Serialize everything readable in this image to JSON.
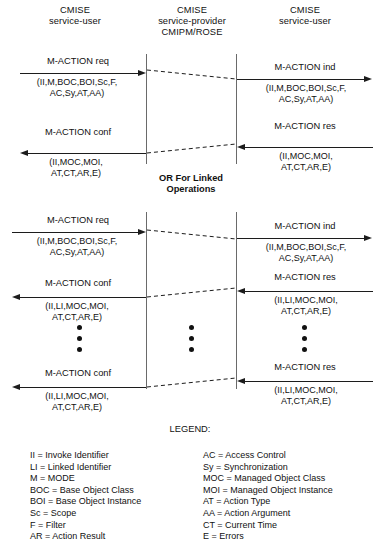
{
  "diagram": {
    "columns": [
      {
        "name": "left-actor",
        "lines": [
          "CMISE",
          "service-user"
        ]
      },
      {
        "name": "provider",
        "lines": [
          "CMISE",
          "service-provider",
          "CMIPM/ROSE"
        ]
      },
      {
        "name": "right-actor",
        "lines": [
          "CMISE",
          "service-user"
        ]
      }
    ],
    "divider_label": [
      "OR For Linked",
      "Operations"
    ],
    "section_unlinked": {
      "messages": [
        {
          "name": "M-ACTION req",
          "params": [
            "(II,M,BOC,BOI,Sc,F,",
            "AC,Sy,AT,AA)"
          ],
          "direction": "right",
          "side": "left"
        },
        {
          "name": "M-ACTION ind",
          "params": [
            "(II,M,BOC,BOI,Sc,F,",
            "AC,Sy,AT,AA)"
          ],
          "direction": "right",
          "side": "right"
        },
        {
          "name": "M-ACTION conf",
          "params": [
            "(II,MOC,MOI,",
            "AT,CT,AR,E)"
          ],
          "direction": "left",
          "side": "left"
        },
        {
          "name": "M-ACTION res",
          "params": [
            "(II,MOC,MOI,",
            "AT,CT,AR,E)"
          ],
          "direction": "left",
          "side": "right"
        }
      ]
    },
    "section_linked": {
      "messages": [
        {
          "name": "M-ACTION req",
          "params": [
            "(II,M,BOC,BOI,Sc,F,",
            "AC,Sy,AT,AA)"
          ],
          "direction": "right",
          "side": "left"
        },
        {
          "name": "M-ACTION ind",
          "params": [
            "(II,M,BOC,BOI,Sc,F,",
            "AC,Sy,AT,AA)"
          ],
          "direction": "right",
          "side": "right"
        },
        {
          "name": "M-ACTION conf",
          "params": [
            "(II,LI,MOC,MOI,",
            "AT,CT,AR,E)"
          ],
          "direction": "left",
          "side": "left"
        },
        {
          "name": "M-ACTION res",
          "params": [
            "(II,LI,MOC,MOI,",
            "AT,CT,AR,E)"
          ],
          "direction": "left",
          "side": "right"
        },
        {
          "name": "M-ACTION conf",
          "params": [
            "(II,LI,MOC,MOI,",
            "AT,CT,AR,E)"
          ],
          "direction": "left",
          "side": "left"
        },
        {
          "name": "M-ACTION res",
          "params": [
            "(II,LI,MOC,MOI,",
            "AT,CT,AR,E)"
          ],
          "direction": "left",
          "side": "right"
        }
      ],
      "ellipsis_dot_count": 3
    },
    "legend": {
      "title": "LEGEND:",
      "left_column": [
        "II = Invoke Identifier",
        "LI = Linked Identifier",
        "M = MODE",
        "BOC = Base Object Class",
        "BOI = Base Object Instance",
        "Sc = Scope",
        "F = Filter",
        "AR = Action Result"
      ],
      "right_column": [
        "AC = Access Control",
        "Sy = Synchronization",
        "MOC = Managed Object Class",
        "MOI = Managed Object Instance",
        "AT = Action Type",
        "AA = Action Argument",
        "CT = Current Time",
        "E = Errors"
      ]
    },
    "colors": {
      "background": "#ffffff",
      "ink": "#1c1c1c",
      "lifeline": "#6a6a6a"
    }
  }
}
